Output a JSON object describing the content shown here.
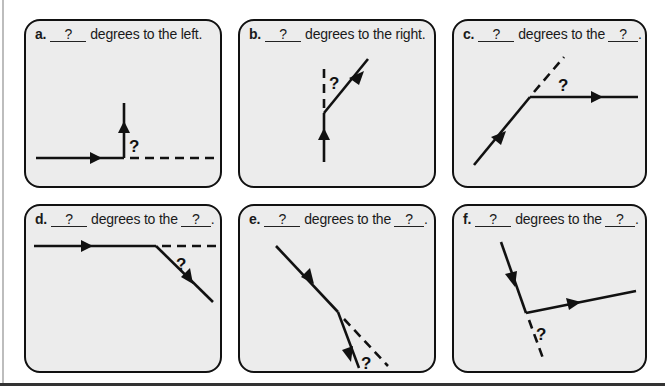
{
  "worksheet": {
    "panels": [
      {
        "id": "a",
        "letter": "a.",
        "blank1": "?",
        "text": "degrees to the left.",
        "blank2": null,
        "end": "",
        "angle_label": "?",
        "turn": "left",
        "description": "Horizontal path heading right, then turning up (left turn); dashed line continues right"
      },
      {
        "id": "b",
        "letter": "b.",
        "blank1": "?",
        "text": "degrees to the right.",
        "blank2": null,
        "end": "",
        "angle_label": "?",
        "turn": "right",
        "description": "Vertical path heading up, then turning up-right; dashed line continues up"
      },
      {
        "id": "c",
        "letter": "c.",
        "blank1": "?",
        "text": "degrees to the",
        "blank2": "?",
        "end": ".",
        "angle_label": "?",
        "turn": "unknown",
        "description": "Diagonal path heading up-right, then turning horizontal right; dashed line continues diagonally"
      },
      {
        "id": "d",
        "letter": "d.",
        "blank1": "?",
        "text": "degrees to the",
        "blank2": "?",
        "end": ".",
        "angle_label": "?",
        "turn": "unknown",
        "description": "Horizontal path heading right, then turning down-right; dashed line continues right"
      },
      {
        "id": "e",
        "letter": "e.",
        "blank1": "?",
        "text": "degrees to the",
        "blank2": "?",
        "end": ".",
        "angle_label": "?",
        "turn": "unknown",
        "description": "Diagonal path heading down-right, then turning steeper down; dashed line continues along original direction"
      },
      {
        "id": "f",
        "letter": "f.",
        "blank1": "?",
        "text": "degrees to the",
        "blank2": "?",
        "end": ".",
        "angle_label": "?",
        "turn": "unknown",
        "description": "Steep path heading down, then turning right slightly upward; dashed line continues down"
      }
    ]
  },
  "colors": {
    "panel_fill": "#ececec",
    "stroke": "#111111",
    "page": "#ffffff"
  }
}
